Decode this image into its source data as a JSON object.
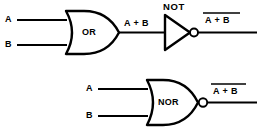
{
  "figure": {
    "line_color": "#000000",
    "background_color": "#ffffff"
  },
  "top_circuit": {
    "input_a_label": "A",
    "input_b_label": "B",
    "gate_label": "OR",
    "gate_type": "or-gate",
    "intermediate_label": "A + B",
    "inverter_label": "NOT",
    "inverter_type": "not-gate",
    "output_label": "A + B",
    "output_overbar": true
  },
  "bottom_circuit": {
    "input_a_label": "A",
    "input_b_label": "B",
    "gate_label": "NOR",
    "gate_type": "nor-gate",
    "output_label": "A + B",
    "output_overbar": true
  }
}
